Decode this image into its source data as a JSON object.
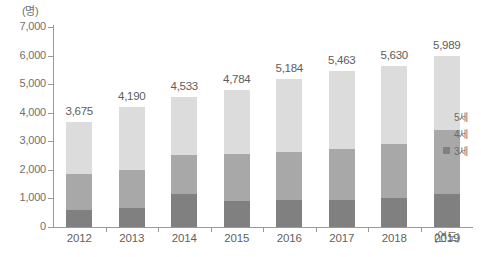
{
  "chart_data": {
    "type": "bar",
    "title": "",
    "subtitle": "",
    "stacked": true,
    "xlabel": "(연도)",
    "ylabel": "(명)",
    "ylim": [
      0,
      7000
    ],
    "yticks": [
      "0",
      "1,000",
      "2,000",
      "3,000",
      "4,000",
      "5,000",
      "6,000",
      "7,000"
    ],
    "ytick_values": [
      0,
      1000,
      2000,
      3000,
      4000,
      5000,
      6000,
      7000
    ],
    "grid": false,
    "legend_position": "right",
    "categories": [
      "2012",
      "2013",
      "2014",
      "2015",
      "2016",
      "2017",
      "2018",
      "2019"
    ],
    "series": [
      {
        "name": "3세",
        "color": "#808080",
        "values": [
          595,
          665,
          1155,
          910,
          945,
          945,
          1015,
          1155
        ]
      },
      {
        "name": "4세",
        "color": "#a8a8a8",
        "values": [
          1260,
          1330,
          1365,
          1645,
          1680,
          1785,
          1890,
          2240
        ]
      },
      {
        "name": "5세",
        "color": "#dcdcdc",
        "values": [
          1820,
          2195,
          2013,
          2229,
          2559,
          2733,
          2725,
          2594
        ]
      }
    ],
    "totals": [
      3675,
      4190,
      4533,
      4784,
      5184,
      5463,
      5630,
      5989
    ],
    "total_labels": [
      "3,675",
      "4,190",
      "4,533",
      "4,784",
      "5,184",
      "5,463",
      "5,630",
      "5,989"
    ],
    "annotations": []
  },
  "axis": {
    "y_unit": "(명)",
    "x_unit": "(연도)"
  },
  "legend": {
    "items": [
      {
        "label": "5세",
        "color": "#dcdcdc"
      },
      {
        "label": "4세",
        "color": "#a8a8a8"
      },
      {
        "label": "3세",
        "color": "#808080"
      }
    ]
  }
}
